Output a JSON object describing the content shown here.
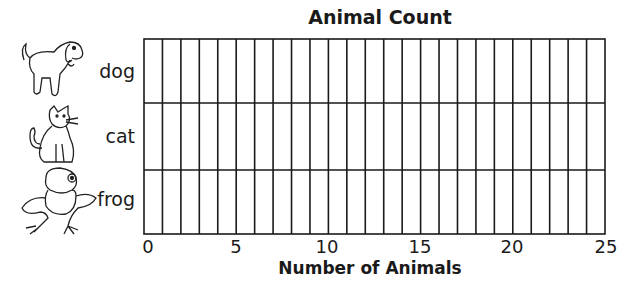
{
  "chart_data": {
    "type": "bar",
    "orientation": "horizontal",
    "title": "Animal Count",
    "xlabel": "Number of Animals",
    "ylabel": "",
    "categories": [
      "dog",
      "cat",
      "frog"
    ],
    "values": [
      null,
      null,
      null
    ],
    "xlim": [
      0,
      25
    ],
    "xticks": [
      0,
      5,
      10,
      15,
      20,
      25
    ],
    "grid": true,
    "grid_columns": 25,
    "note": "Blank bar graph template; no bars filled in"
  },
  "labels": {
    "title": "Animal Count",
    "xlabel": "Number of Animals",
    "categories": [
      "dog",
      "cat",
      "frog"
    ],
    "ticks": [
      "0",
      "5",
      "10",
      "15",
      "20",
      "25"
    ]
  },
  "icons": [
    "dog-picture-icon",
    "cat-picture-icon",
    "frog-picture-icon"
  ],
  "colors": {
    "line": "#1a1a1a",
    "background": "#ffffff"
  }
}
